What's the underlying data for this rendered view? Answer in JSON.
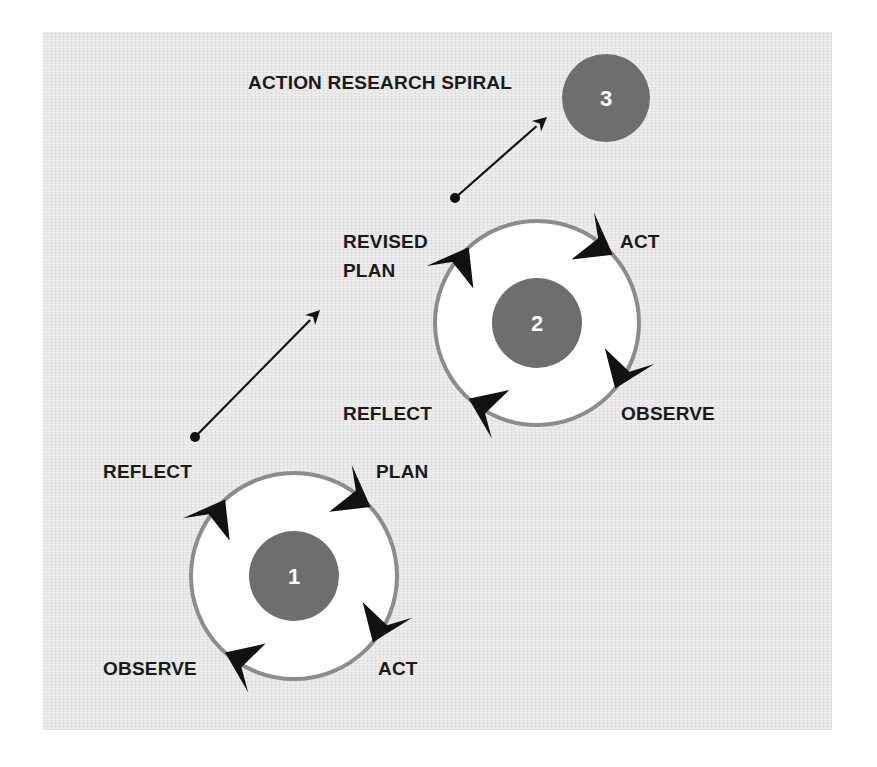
{
  "title": "ACTION RESEARCH SPIRAL",
  "colors": {
    "panel": "#ececec",
    "ring": "#8c8c8c",
    "ring_fill": "#ffffff",
    "core": "#6e6e6e",
    "arrow": "#111111",
    "text": "#1a1a1a"
  },
  "cycles": [
    {
      "number": "1",
      "center": [
        294,
        576
      ],
      "ring_radius": 103,
      "core_radius": 45,
      "labels": {
        "top_left": "REFLECT",
        "top_right": "PLAN",
        "bottom_right": "ACT",
        "bottom_left": "OBSERVE"
      },
      "arrow_angles": [
        -42,
        40,
        132,
        -132
      ]
    },
    {
      "number": "2",
      "center": [
        537,
        323
      ],
      "ring_radius": 102,
      "core_radius": 45,
      "labels": {
        "top_left_line1": "REVISED",
        "top_left_line2": "PLAN",
        "top_right": "ACT",
        "bottom_right": "OBSERVE",
        "bottom_left": "REFLECT"
      },
      "arrow_angles": [
        -42,
        40,
        132,
        -132
      ]
    },
    {
      "number": "3",
      "center": [
        606,
        98
      ],
      "core_radius": 44
    }
  ],
  "connectors": [
    {
      "from": [
        195,
        437
      ],
      "to": [
        320,
        310
      ]
    },
    {
      "from": [
        455,
        198
      ],
      "to": [
        547,
        117
      ]
    }
  ]
}
